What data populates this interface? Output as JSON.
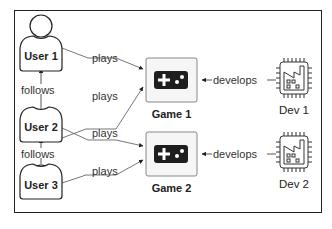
{
  "diagram": {
    "type": "graph",
    "users": [
      {
        "id": "user1",
        "label": "User 1"
      },
      {
        "id": "user2",
        "label": "User 2"
      },
      {
        "id": "user3",
        "label": "User 3"
      }
    ],
    "games": [
      {
        "id": "game1",
        "label": "Game 1"
      },
      {
        "id": "game2",
        "label": "Game 2"
      }
    ],
    "developers": [
      {
        "id": "dev1",
        "label": "Dev 1"
      },
      {
        "id": "dev2",
        "label": "Dev 2"
      }
    ],
    "edges": [
      {
        "from": "user2",
        "to": "user1",
        "label": "follows"
      },
      {
        "from": "user3",
        "to": "user2",
        "label": "follows"
      },
      {
        "from": "user1",
        "to": "game1",
        "label": "plays"
      },
      {
        "from": "user2",
        "to": "game1",
        "label": "plays"
      },
      {
        "from": "user2",
        "to": "game2",
        "label": "plays"
      },
      {
        "from": "user3",
        "to": "game2",
        "label": "plays"
      },
      {
        "from": "dev1",
        "to": "game1",
        "label": "develops"
      },
      {
        "from": "dev2",
        "to": "game2",
        "label": "develops"
      }
    ],
    "icons": {
      "user": "person-icon",
      "game": "gamepad-icon",
      "developer": "factory-chip-icon"
    },
    "colors": {
      "stroke": "#222222",
      "edge": "#555555",
      "game_box_fill": "#f6f6f6",
      "gamepad_fill": "#1e1e1e"
    }
  }
}
